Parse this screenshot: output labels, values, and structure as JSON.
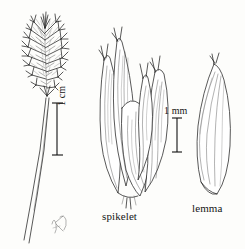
{
  "plate": {
    "kind": "botanical-line-illustration",
    "subject": "grass",
    "background_color": "#fdfdfb",
    "ink_color": "#1b1b1b",
    "width": 245,
    "height": 249
  },
  "panels": [
    {
      "id": "panicle",
      "name": "panicle-figure",
      "caption": "",
      "description": "narrow dense panicle on a slender culm"
    },
    {
      "id": "spikelet",
      "name": "spikelet-figure",
      "caption": "spikelet",
      "description": "spikelet with overlapping lanceolate glumes and florets"
    },
    {
      "id": "lemma",
      "name": "lemma-figure",
      "caption": "lemma",
      "description": "single lanceolate lemma with longitudinal veins"
    }
  ],
  "labels": {
    "spikelet": "spikelet",
    "lemma": "lemma"
  },
  "scalebars": [
    {
      "id": "cm",
      "label": "1 cm",
      "orientation": "vertical",
      "label_rotation": "-90",
      "applies_to": "panicle"
    },
    {
      "id": "mm",
      "label": "1 mm",
      "orientation": "vertical",
      "label_rotation": "0",
      "applies_to": "spikelet-and-lemma"
    }
  ],
  "signature": {
    "name": "artist-monogram",
    "text": ""
  }
}
